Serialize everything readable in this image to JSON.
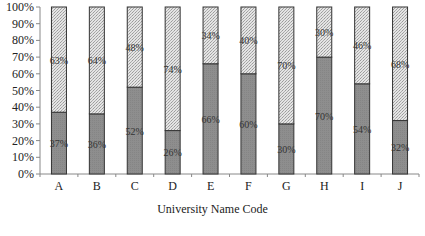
{
  "chart_data": {
    "type": "bar",
    "stacked": true,
    "title": "",
    "xlabel": "University Name Code",
    "ylabel": "",
    "ylim": [
      0,
      100
    ],
    "y_ticks": [
      "0%",
      "10%",
      "20%",
      "30%",
      "40%",
      "50%",
      "60%",
      "70%",
      "80%",
      "90%",
      "100%"
    ],
    "categories": [
      "A",
      "B",
      "C",
      "D",
      "E",
      "F",
      "G",
      "H",
      "I",
      "J"
    ],
    "series": [
      {
        "name": "lower (dark gray)",
        "color": "#8c8c8c",
        "values": [
          37,
          36,
          52,
          26,
          66,
          60,
          30,
          70,
          54,
          32
        ],
        "labels": [
          "37%",
          "36%",
          "52%",
          "26%",
          "66%",
          "60%",
          "30%",
          "70%",
          "54%",
          "32%"
        ]
      },
      {
        "name": "upper (light hatched)",
        "color": "#cfcfcf",
        "values": [
          63,
          64,
          48,
          74,
          34,
          40,
          70,
          30,
          46,
          68
        ],
        "labels": [
          "63%",
          "64%",
          "48%",
          "74%",
          "34%",
          "40%",
          "70%",
          "30%",
          "46%",
          "68%"
        ]
      }
    ],
    "grid": false,
    "legend": "none"
  }
}
